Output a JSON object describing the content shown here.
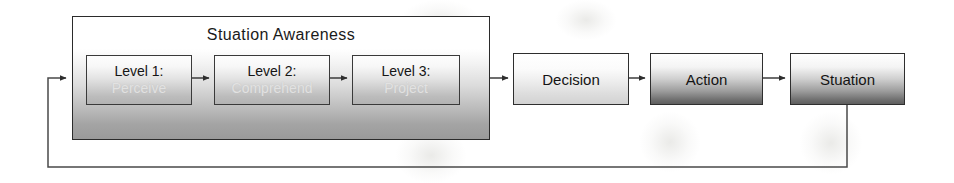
{
  "diagram": {
    "title": "Stuation Awareness",
    "container": {
      "label": "Stuation Awareness"
    },
    "levels": [
      {
        "heading": "Level 1:",
        "subtitle": "Perceive"
      },
      {
        "heading": "Level 2:",
        "subtitle": "Comprehend"
      },
      {
        "heading": "Level 3:",
        "subtitle": "Project"
      }
    ],
    "stages": [
      {
        "label": "Decision"
      },
      {
        "label": "Action"
      },
      {
        "label": "Stuation"
      }
    ],
    "colors": {
      "outline": "#2b2b2b",
      "connector": "#4a4a4a",
      "faded_text": "#e2e2e2",
      "text": "#141414"
    }
  }
}
